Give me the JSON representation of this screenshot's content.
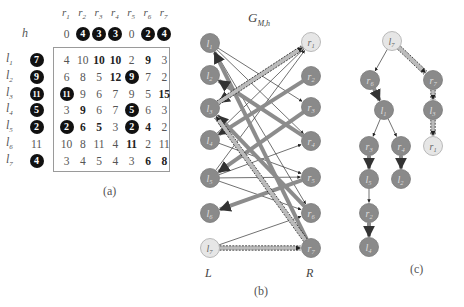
{
  "panel_a": {
    "caption": "(a)",
    "h_label": "h",
    "col_labels": [
      "r1",
      "r2",
      "r3",
      "r4",
      "r5",
      "r6",
      "r7"
    ],
    "h_values": [
      {
        "v": "0",
        "circled": false
      },
      {
        "v": "4",
        "circled": true
      },
      {
        "v": "3",
        "circled": true
      },
      {
        "v": "3",
        "circled": true
      },
      {
        "v": "0",
        "circled": false
      },
      {
        "v": "2",
        "circled": true
      },
      {
        "v": "4",
        "circled": true
      }
    ],
    "rows": [
      {
        "label": "l1",
        "h": {
          "v": "7",
          "circled": true
        },
        "cells": [
          {
            "v": "4"
          },
          {
            "v": "10"
          },
          {
            "v": "10",
            "bold": true
          },
          {
            "v": "10",
            "bold": true
          },
          {
            "v": "2"
          },
          {
            "v": "9",
            "bold": true
          },
          {
            "v": "3"
          }
        ]
      },
      {
        "label": "l2",
        "h": {
          "v": "9",
          "circled": true
        },
        "cells": [
          {
            "v": "6"
          },
          {
            "v": "8"
          },
          {
            "v": "5"
          },
          {
            "v": "12",
            "bold": true
          },
          {
            "v": "9",
            "circled": true
          },
          {
            "v": "7"
          },
          {
            "v": "2"
          }
        ]
      },
      {
        "label": "l3",
        "h": {
          "v": "11",
          "circled": true
        },
        "cells": [
          {
            "v": "11",
            "circled": true
          },
          {
            "v": "9"
          },
          {
            "v": "6"
          },
          {
            "v": "7"
          },
          {
            "v": "9"
          },
          {
            "v": "5"
          },
          {
            "v": "15",
            "bold": true
          }
        ]
      },
      {
        "label": "l4",
        "h": {
          "v": "5",
          "circled": true
        },
        "cells": [
          {
            "v": "3"
          },
          {
            "v": "9",
            "bold": true
          },
          {
            "v": "6"
          },
          {
            "v": "7"
          },
          {
            "v": "5",
            "circled": true
          },
          {
            "v": "6"
          },
          {
            "v": "3"
          }
        ]
      },
      {
        "label": "l5",
        "h": {
          "v": "2",
          "circled": true
        },
        "cells": [
          {
            "v": "2",
            "circled": true
          },
          {
            "v": "6",
            "bold": true
          },
          {
            "v": "5",
            "bold": true
          },
          {
            "v": "3"
          },
          {
            "v": "2",
            "circled": true
          },
          {
            "v": "4",
            "bold": true
          },
          {
            "v": "2"
          }
        ]
      },
      {
        "label": "l6",
        "h": {
          "v": "11",
          "circled": false
        },
        "cells": [
          {
            "v": "10"
          },
          {
            "v": "8"
          },
          {
            "v": "11"
          },
          {
            "v": "4"
          },
          {
            "v": "11",
            "bold": true
          },
          {
            "v": "2"
          },
          {
            "v": "11"
          }
        ]
      },
      {
        "label": "l7",
        "h": {
          "v": "4",
          "circled": true
        },
        "cells": [
          {
            "v": "3"
          },
          {
            "v": "4"
          },
          {
            "v": "5"
          },
          {
            "v": "4"
          },
          {
            "v": "3"
          },
          {
            "v": "6",
            "bold": true
          },
          {
            "v": "8",
            "bold": true
          }
        ]
      }
    ]
  },
  "panel_b": {
    "title": "G_M,h",
    "title_main": "G",
    "title_sub": "M,h",
    "caption": "(b)",
    "left_side_label": "L",
    "right_side_label": "R",
    "left_nodes": [
      {
        "id": "l1",
        "label": "l1",
        "x": 210,
        "y": 43,
        "light": false
      },
      {
        "id": "l2",
        "label": "l2",
        "x": 210,
        "y": 75,
        "light": false
      },
      {
        "id": "l3",
        "label": "l3",
        "x": 210,
        "y": 108,
        "light": false
      },
      {
        "id": "l4",
        "label": "l4",
        "x": 210,
        "y": 140,
        "light": false
      },
      {
        "id": "l5",
        "label": "l5",
        "x": 210,
        "y": 178,
        "light": false
      },
      {
        "id": "l6",
        "label": "l6",
        "x": 210,
        "y": 213,
        "light": false
      },
      {
        "id": "l7",
        "label": "l7",
        "x": 210,
        "y": 248,
        "light": true
      }
    ],
    "right_nodes": [
      {
        "id": "r1",
        "label": "r1",
        "x": 311,
        "y": 42,
        "light": true
      },
      {
        "id": "r2",
        "label": "r2",
        "x": 311,
        "y": 76,
        "light": false
      },
      {
        "id": "r3",
        "label": "r3",
        "x": 311,
        "y": 107,
        "light": false
      },
      {
        "id": "r4",
        "label": "r4",
        "x": 311,
        "y": 141,
        "light": false
      },
      {
        "id": "r5",
        "label": "r5",
        "x": 311,
        "y": 177,
        "light": false
      },
      {
        "id": "r6",
        "label": "r6",
        "x": 311,
        "y": 213,
        "light": false
      },
      {
        "id": "r7",
        "label": "r7",
        "x": 311,
        "y": 248,
        "light": false
      }
    ],
    "thin_edges": [
      [
        "l1",
        "r3"
      ],
      [
        "l1",
        "r4"
      ],
      [
        "l1",
        "r6"
      ],
      [
        "l4",
        "r5"
      ],
      [
        "l4",
        "r1"
      ],
      [
        "l5",
        "r5"
      ],
      [
        "l5",
        "r6"
      ],
      [
        "l5",
        "r1"
      ],
      [
        "l5",
        "r4"
      ],
      [
        "l7",
        "r6"
      ]
    ],
    "matching_edges": [
      [
        "r7",
        "l1"
      ],
      [
        "r4",
        "l2"
      ],
      [
        "r1",
        "l3"
      ],
      [
        "r2",
        "l4"
      ],
      [
        "r3",
        "l5"
      ],
      [
        "r5",
        "l6"
      ],
      [
        "r6",
        "l3"
      ]
    ],
    "augmenting_path": [
      [
        "l7",
        "r7"
      ],
      [
        "r7",
        "l3"
      ],
      [
        "l3",
        "r1"
      ]
    ]
  },
  "panel_c": {
    "caption": "(c)",
    "nodes": [
      {
        "id": "l7",
        "label": "l7",
        "x": 392,
        "y": 41,
        "light": true
      },
      {
        "id": "r6",
        "label": "r6",
        "x": 370,
        "y": 80,
        "light": false
      },
      {
        "id": "r7",
        "label": "r7",
        "x": 433,
        "y": 80,
        "light": false
      },
      {
        "id": "l1",
        "label": "l1",
        "x": 384,
        "y": 110,
        "light": false
      },
      {
        "id": "l3",
        "label": "l3",
        "x": 433,
        "y": 110,
        "light": false
      },
      {
        "id": "r3",
        "label": "r3",
        "x": 369,
        "y": 146,
        "light": false
      },
      {
        "id": "r4",
        "label": "r4",
        "x": 401,
        "y": 146,
        "light": false
      },
      {
        "id": "r1",
        "label": "r1",
        "x": 433,
        "y": 146,
        "light": true
      },
      {
        "id": "l5",
        "label": "l5",
        "x": 369,
        "y": 179,
        "light": false
      },
      {
        "id": "l2",
        "label": "l2",
        "x": 401,
        "y": 179,
        "light": false
      },
      {
        "id": "r2",
        "label": "r2",
        "x": 369,
        "y": 213,
        "light": false
      },
      {
        "id": "l4",
        "label": "l4",
        "x": 369,
        "y": 247,
        "light": false
      }
    ],
    "edges": [
      {
        "from": "l7",
        "to": "r6",
        "type": "thin"
      },
      {
        "from": "l7",
        "to": "r7",
        "type": "path"
      },
      {
        "from": "r6",
        "to": "l1",
        "type": "matching"
      },
      {
        "from": "r7",
        "to": "l3",
        "type": "path"
      },
      {
        "from": "l1",
        "to": "r3",
        "type": "thin"
      },
      {
        "from": "l1",
        "to": "r4",
        "type": "thin"
      },
      {
        "from": "l3",
        "to": "r1",
        "type": "path"
      },
      {
        "from": "r3",
        "to": "l5",
        "type": "matching"
      },
      {
        "from": "r4",
        "to": "l2",
        "type": "matching"
      },
      {
        "from": "l5",
        "to": "r2",
        "type": "thin"
      },
      {
        "from": "r2",
        "to": "l4",
        "type": "matching"
      }
    ]
  },
  "colors": {
    "node_fill": "#8a8a8a",
    "node_light_fill": "#e6e6e6",
    "matching_edge": "#8c8c8c",
    "thin_edge": "#333333",
    "path_edge": "#222222"
  }
}
